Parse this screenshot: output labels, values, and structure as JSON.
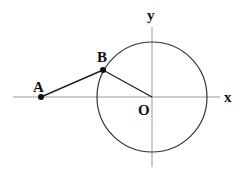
{
  "diagram": {
    "axes": {
      "x_label": "x",
      "y_label": "y"
    },
    "points": [
      {
        "name": "A",
        "label": "A"
      },
      {
        "name": "B",
        "label": "B"
      },
      {
        "name": "O",
        "label": "O"
      }
    ],
    "elements": [
      "circle centered at O",
      "segment AB",
      "segment BO",
      "x-axis",
      "y-axis"
    ]
  }
}
